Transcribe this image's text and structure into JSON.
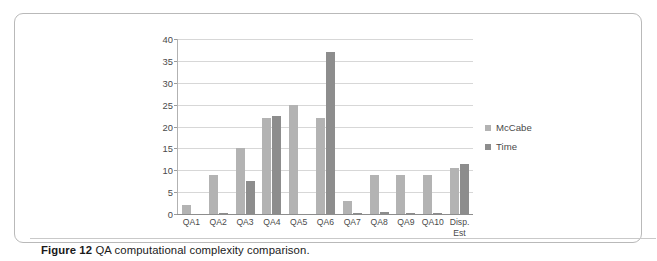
{
  "figure": {
    "caption_label": "Figure 12",
    "caption_text": "QA computational complexity comparison."
  },
  "chart_data": {
    "type": "bar",
    "title": "",
    "xlabel": "",
    "ylabel": "",
    "ylim": [
      0,
      40
    ],
    "yticks": [
      0,
      5,
      10,
      15,
      20,
      25,
      30,
      35,
      40
    ],
    "grid": true,
    "legend_position": "right",
    "categories": [
      "QA1",
      "QA2",
      "QA3",
      "QA4",
      "QA5",
      "QA6",
      "QA7",
      "QA8",
      "QA9",
      "QA10",
      "Disp.\nEst"
    ],
    "series": [
      {
        "name": "McCabe",
        "color": "#b3b3b3",
        "values": [
          2,
          9,
          15,
          22,
          25,
          22,
          3,
          9,
          9,
          9,
          10.5
        ]
      },
      {
        "name": "Time",
        "color": "#8d8d8d",
        "values": [
          0,
          0.3,
          7.5,
          22.4,
          0,
          37,
          0.3,
          0.5,
          0.3,
          0.3,
          11.5
        ]
      }
    ]
  }
}
